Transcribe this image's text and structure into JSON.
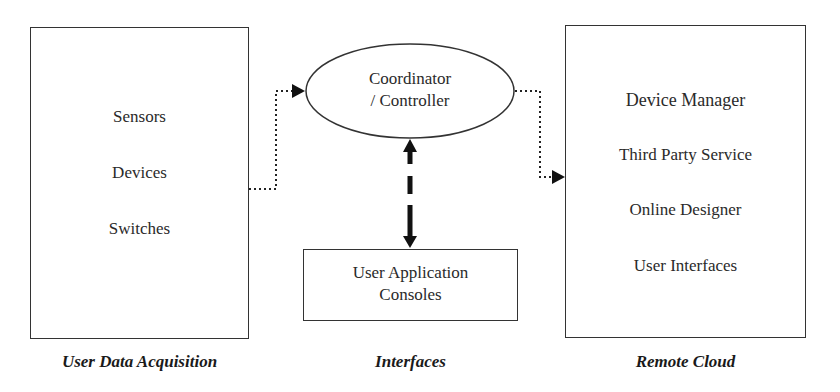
{
  "diagram": {
    "type": "architecture-block-diagram",
    "colors": {
      "stroke": "#333333",
      "text": "#2a2a2a",
      "background": "#ffffff"
    }
  },
  "user_data_acquisition": {
    "label": "User Data Acquisition",
    "items": [
      "Sensors",
      "Devices",
      "Switches"
    ]
  },
  "interfaces": {
    "label": "Interfaces",
    "coordinator": {
      "line1": "Coordinator",
      "line2": "/ Controller"
    },
    "console": {
      "line1": "User Application",
      "line2": "Consoles"
    }
  },
  "remote_cloud": {
    "label": "Remote Cloud",
    "items": [
      "Device Manager",
      "Third Party Service",
      "Online Designer",
      "User Interfaces"
    ]
  },
  "connections": [
    {
      "from": "User Data Acquisition",
      "to": "Coordinator / Controller",
      "style": "dotted",
      "direction": "forward"
    },
    {
      "from": "Coordinator / Controller",
      "to": "Remote Cloud",
      "style": "dotted",
      "direction": "forward"
    },
    {
      "from": "Coordinator / Controller",
      "to": "User Application Consoles",
      "style": "thick-dashed",
      "direction": "bidirectional"
    }
  ]
}
